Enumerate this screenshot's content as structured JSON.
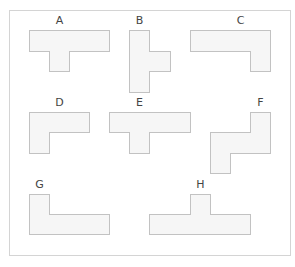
{
  "grid": {
    "columns": 14,
    "rows": 12,
    "cell_width": 20.07,
    "cell_height": 20.4,
    "colors": {
      "line": "#d4d4d4",
      "shape_fill": "#f6f6f6",
      "shape_edge": "#c2c2c2",
      "label": "#444444"
    }
  },
  "labels": [
    {
      "text": "A",
      "col": 2,
      "row": 0
    },
    {
      "text": "B",
      "col": 6,
      "row": 0
    },
    {
      "text": "C",
      "col": 11,
      "row": 0
    },
    {
      "text": "D",
      "col": 2,
      "row": 4
    },
    {
      "text": "E",
      "col": 6,
      "row": 4
    },
    {
      "text": "F",
      "col": 12,
      "row": 4
    },
    {
      "text": "G",
      "col": 1,
      "row": 8
    },
    {
      "text": "H",
      "col": 9,
      "row": 8
    }
  ],
  "shapes": [
    {
      "label": "A",
      "cells": [
        [
          1,
          1
        ],
        [
          2,
          1
        ],
        [
          3,
          1
        ],
        [
          4,
          1
        ],
        [
          2,
          2
        ]
      ]
    },
    {
      "label": "B",
      "cells": [
        [
          6,
          1
        ],
        [
          6,
          2
        ],
        [
          6,
          3
        ],
        [
          7,
          2
        ]
      ]
    },
    {
      "label": "C",
      "cells": [
        [
          9,
          1
        ],
        [
          10,
          1
        ],
        [
          11,
          1
        ],
        [
          12,
          1
        ],
        [
          12,
          2
        ]
      ]
    },
    {
      "label": "D",
      "cells": [
        [
          1,
          5
        ],
        [
          2,
          5
        ],
        [
          3,
          5
        ],
        [
          1,
          6
        ]
      ]
    },
    {
      "label": "E",
      "cells": [
        [
          5,
          5
        ],
        [
          6,
          5
        ],
        [
          7,
          5
        ],
        [
          8,
          5
        ],
        [
          6,
          6
        ]
      ]
    },
    {
      "label": "F",
      "cells": [
        [
          12,
          5
        ],
        [
          10,
          6
        ],
        [
          11,
          6
        ],
        [
          12,
          6
        ],
        [
          10,
          7
        ]
      ]
    },
    {
      "label": "G",
      "cells": [
        [
          1,
          9
        ],
        [
          1,
          10
        ],
        [
          2,
          10
        ],
        [
          3,
          10
        ],
        [
          4,
          10
        ]
      ]
    },
    {
      "label": "H",
      "cells": [
        [
          9,
          9
        ],
        [
          7,
          10
        ],
        [
          8,
          10
        ],
        [
          9,
          10
        ],
        [
          10,
          10
        ],
        [
          11,
          10
        ]
      ]
    }
  ]
}
